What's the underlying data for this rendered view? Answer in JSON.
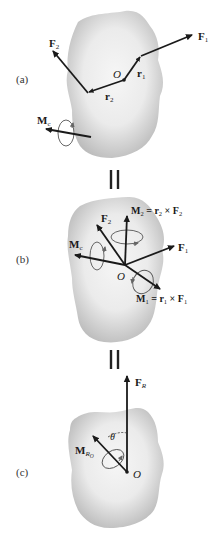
{
  "figure": {
    "panels": [
      {
        "id": "a",
        "label": "(a)",
        "origin_label": "O",
        "vectors": {
          "F1": {
            "sym": "F",
            "sub": "1"
          },
          "F2": {
            "sym": "F",
            "sub": "2"
          },
          "r1": {
            "sym": "r",
            "sub": "1"
          },
          "r2": {
            "sym": "r",
            "sub": "2"
          },
          "Mc": {
            "sym": "M",
            "sub": "c"
          }
        }
      },
      {
        "id": "b",
        "label": "(b)",
        "origin_label": "O",
        "vectors": {
          "F1": {
            "sym": "F",
            "sub": "1"
          },
          "F2": {
            "sym": "F",
            "sub": "2"
          },
          "Mc": {
            "sym": "M",
            "sub": "c"
          },
          "M2": {
            "sym": "M",
            "sub": "2",
            "eq": " = r",
            "eq_sub": "2",
            "cross": " × F",
            "cross_sub": "2"
          },
          "M1": {
            "sym": "M",
            "sub": "1",
            "eq": " = r",
            "eq_sub": "1",
            "cross": " × F",
            "cross_sub": "1"
          }
        }
      },
      {
        "id": "c",
        "label": "(c)",
        "origin_label": "O",
        "angle_label": "θ",
        "vectors": {
          "FR": {
            "sym": "F",
            "sub": "R"
          },
          "MRO": {
            "sym": "M",
            "sub": "R",
            "subsub": "O"
          }
        }
      }
    ],
    "equivalence_symbol": "||",
    "colors": {
      "body_fill_center": "#f4f4f4",
      "body_fill_edge": "#bdbdbd",
      "vector": "#1a1a1a",
      "background": "#ffffff"
    }
  }
}
